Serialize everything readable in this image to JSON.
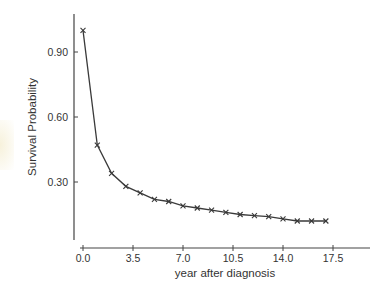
{
  "chart_data": {
    "type": "line",
    "title": "",
    "xlabel": "year after diagnosis",
    "ylabel": "Survival Probability",
    "x": [
      0,
      1,
      2,
      3,
      4,
      5,
      6,
      7,
      8,
      9,
      10,
      11,
      12,
      13,
      14,
      15,
      16,
      17
    ],
    "series": [
      {
        "name": "Survival Probability",
        "marker": "x",
        "values": [
          1.0,
          0.47,
          0.34,
          0.28,
          0.25,
          0.22,
          0.21,
          0.19,
          0.18,
          0.17,
          0.16,
          0.15,
          0.145,
          0.14,
          0.13,
          0.12,
          0.12,
          0.12
        ]
      }
    ],
    "xticks": [
      "0.0",
      "3.5",
      "7.0",
      "10.5",
      "14.0",
      "17.5"
    ],
    "yticks": [
      "0.30",
      "0.60",
      "0.90"
    ],
    "xlim": [
      0,
      20
    ],
    "ylim": [
      0,
      1.05
    ],
    "grid": false,
    "legend": null
  },
  "colors": {
    "line": "#3a3a3a",
    "axis": "#444444",
    "text": "#333333",
    "background": "#ffffff"
  }
}
